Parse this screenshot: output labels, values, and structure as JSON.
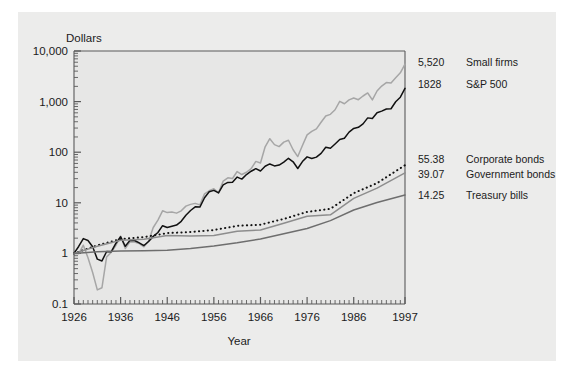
{
  "chart_data": {
    "type": "line",
    "title": "",
    "xlabel": "Year",
    "ylabel": "Dollars",
    "yscale": "log",
    "ylim": [
      0.1,
      10000
    ],
    "xlim": [
      1926,
      1997
    ],
    "grid": false,
    "legend_position": "right-of-axes",
    "ytick_labels": [
      "10,000",
      "1,000",
      "100",
      "10",
      "1",
      "0.1"
    ],
    "ytick_values": [
      10000,
      1000,
      100,
      10,
      1,
      0.1
    ],
    "xtick_labels": [
      "1926",
      "1936",
      "1946",
      "1956",
      "1966",
      "1976",
      "1986",
      "1997"
    ],
    "xtick_values": [
      1926,
      1936,
      1946,
      1956,
      1966,
      1976,
      1986,
      1997
    ],
    "series": [
      {
        "name": "Small firms",
        "end_value": "5,520",
        "end_value_number": 5520,
        "color": "#a6a6a6",
        "style": "solid",
        "x": [
          1926,
          1927,
          1928,
          1929,
          1930,
          1931,
          1932,
          1933,
          1934,
          1935,
          1936,
          1937,
          1938,
          1939,
          1940,
          1941,
          1942,
          1943,
          1944,
          1945,
          1946,
          1947,
          1948,
          1949,
          1950,
          1951,
          1952,
          1953,
          1954,
          1955,
          1956,
          1957,
          1958,
          1959,
          1960,
          1961,
          1962,
          1963,
          1964,
          1965,
          1966,
          1967,
          1968,
          1969,
          1970,
          1971,
          1972,
          1973,
          1974,
          1975,
          1976,
          1977,
          1978,
          1979,
          1980,
          1981,
          1982,
          1983,
          1984,
          1985,
          1986,
          1987,
          1988,
          1989,
          1990,
          1991,
          1992,
          1993,
          1994,
          1995,
          1996,
          1997
        ],
        "values": [
          1.0,
          0.98,
          1.45,
          0.82,
          0.42,
          0.19,
          0.21,
          0.85,
          1.05,
          1.45,
          2.2,
          1.25,
          1.7,
          1.68,
          1.56,
          1.35,
          1.75,
          3.25,
          4.55,
          6.95,
          6.4,
          6.55,
          6.25,
          6.95,
          8.6,
          9.3,
          9.75,
          9.1,
          15.0,
          17.3,
          19.0,
          15.7,
          26.8,
          31.2,
          30.2,
          41.5,
          36.2,
          40.1,
          47.2,
          65.8,
          61.0,
          128.0,
          185.0,
          141.0,
          129.0,
          158.0,
          172.0,
          112.0,
          82.0,
          136.0,
          220.0,
          257.0,
          289.0,
          390.0,
          520.0,
          560.0,
          690.0,
          1010.0,
          905.0,
          1080.0,
          1180.0,
          1090.0,
          1290.0,
          1480.0,
          1080.0,
          1620.0,
          2030.0,
          2380.0,
          2340.0,
          2960.0,
          3700.0,
          5520.0
        ]
      },
      {
        "name": "S&P 500",
        "end_value": "1828",
        "end_value_number": 1828,
        "color": "#111111",
        "style": "solid",
        "x": [
          1926,
          1927,
          1928,
          1929,
          1930,
          1931,
          1932,
          1933,
          1934,
          1935,
          1936,
          1937,
          1938,
          1939,
          1940,
          1941,
          1942,
          1943,
          1944,
          1945,
          1946,
          1947,
          1948,
          1949,
          1950,
          1951,
          1952,
          1953,
          1954,
          1955,
          1956,
          1957,
          1958,
          1959,
          1960,
          1961,
          1962,
          1963,
          1964,
          1965,
          1966,
          1967,
          1968,
          1969,
          1970,
          1971,
          1972,
          1973,
          1974,
          1975,
          1976,
          1977,
          1978,
          1979,
          1980,
          1981,
          1982,
          1983,
          1984,
          1985,
          1986,
          1987,
          1988,
          1989,
          1990,
          1991,
          1992,
          1993,
          1994,
          1995,
          1996,
          1997
        ],
        "values": [
          1.0,
          1.37,
          1.96,
          1.8,
          1.35,
          0.77,
          0.71,
          1.09,
          1.08,
          1.59,
          2.13,
          1.38,
          1.81,
          1.8,
          1.62,
          1.43,
          1.72,
          2.17,
          2.59,
          3.53,
          3.25,
          3.44,
          3.63,
          4.31,
          5.68,
          7.04,
          8.33,
          8.24,
          12.57,
          16.53,
          17.62,
          15.72,
          22.56,
          25.27,
          25.39,
          32.22,
          29.4,
          36.11,
          42.06,
          47.32,
          42.56,
          52.76,
          58.6,
          53.6,
          55.73,
          63.69,
          75.78,
          64.67,
          47.56,
          65.28,
          80.88,
          75.07,
          80.0,
          94.8,
          125.6,
          119.4,
          145.1,
          177.8,
          189.0,
          249.0,
          295.3,
          310.8,
          362.3,
          476.8,
          461.9,
          602.6,
          648.6,
          713.8,
          723.1,
          995.0,
          1223.0,
          1828.0
        ]
      },
      {
        "name": "Corporate bonds",
        "end_value": "55.38",
        "end_value_number": 55.38,
        "color": "#111111",
        "style": "dotted",
        "x": [
          1926,
          1931,
          1936,
          1941,
          1946,
          1951,
          1956,
          1961,
          1966,
          1971,
          1976,
          1981,
          1986,
          1991,
          1997
        ],
        "values": [
          1.0,
          1.44,
          1.92,
          2.1,
          2.52,
          2.65,
          2.9,
          3.5,
          3.7,
          4.8,
          6.6,
          7.6,
          15.5,
          24.5,
          55.38
        ]
      },
      {
        "name": "Government bonds",
        "end_value": "39.07",
        "end_value_number": 39.07,
        "color": "#8d8d8d",
        "style": "solid",
        "x": [
          1926,
          1931,
          1936,
          1941,
          1946,
          1951,
          1956,
          1961,
          1966,
          1971,
          1976,
          1981,
          1986,
          1991,
          1997
        ],
        "values": [
          1.0,
          1.38,
          1.82,
          1.9,
          2.25,
          2.2,
          2.25,
          2.75,
          2.9,
          3.95,
          5.4,
          5.8,
          12.2,
          19.5,
          39.07
        ]
      },
      {
        "name": "Treasury bills",
        "end_value": "14.25",
        "end_value_number": 14.25,
        "color": "#6e6e6e",
        "style": "solid",
        "x": [
          1926,
          1931,
          1936,
          1941,
          1946,
          1951,
          1956,
          1961,
          1966,
          1971,
          1976,
          1981,
          1986,
          1991,
          1997
        ],
        "values": [
          1.0,
          1.08,
          1.11,
          1.13,
          1.16,
          1.25,
          1.4,
          1.62,
          1.92,
          2.45,
          3.1,
          4.45,
          7.2,
          10.1,
          14.25
        ]
      }
    ],
    "legend_entries": [
      {
        "value": "5,520",
        "label": "Small firms"
      },
      {
        "value": "1828",
        "label": "S&P 500"
      },
      {
        "value": "55.38",
        "label": "Corporate bonds"
      },
      {
        "value": "39.07",
        "label": "Government bonds"
      },
      {
        "value": "14.25",
        "label": "Treasury bills"
      }
    ],
    "colors": {
      "figure_background": "#ececeb",
      "plot_background": "#ececeb",
      "axis": "#5a5a5a",
      "text": "#1b1b1b"
    }
  }
}
